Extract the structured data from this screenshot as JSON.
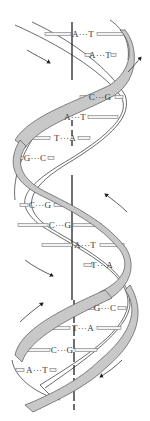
{
  "figure": {
    "colors": {
      "ribbon_fill": "#c8c8c8",
      "ribbon_stroke": "#555555",
      "strand": "#444444",
      "axis": "#222222",
      "bond_bar": "#f2f2f2",
      "bond_stroke": "#777777",
      "text": "#333333"
    },
    "base_pairs": [
      {
        "label": "A···T",
        "left": "A",
        "right": "T",
        "x": 83,
        "y": 34
      },
      {
        "label": "A···T",
        "left": "A",
        "right": "T",
        "x": 100,
        "y": 55
      },
      {
        "label": "C···G",
        "left": "C",
        "right": "G",
        "x": 100,
        "y": 97
      },
      {
        "label": "A···T",
        "left": "A",
        "right": "T",
        "x": 75,
        "y": 117
      },
      {
        "label": "T···A",
        "left": "T",
        "right": "A",
        "x": 65,
        "y": 138
      },
      {
        "label": "G···C",
        "left": "G",
        "right": "C",
        "x": 35,
        "y": 158
      },
      {
        "label": "C···G",
        "left": "C",
        "right": "G",
        "x": 40,
        "y": 205
      },
      {
        "label": "C···G",
        "left": "C",
        "right": "G",
        "x": 60,
        "y": 225
      },
      {
        "label": "A···T",
        "left": "A",
        "right": "T",
        "x": 85,
        "y": 245
      },
      {
        "label": "T···A",
        "left": "T",
        "right": "A",
        "x": 102,
        "y": 265
      },
      {
        "label": "G···C",
        "left": "G",
        "right": "C",
        "x": 105,
        "y": 308
      },
      {
        "label": "T···A",
        "left": "T",
        "right": "A",
        "x": 83,
        "y": 328
      },
      {
        "label": "C···G",
        "left": "C",
        "right": "G",
        "x": 62,
        "y": 350
      },
      {
        "label": "A···T",
        "left": "A",
        "right": "T",
        "x": 37,
        "y": 370
      }
    ],
    "arrows": [
      {
        "name": "strand-direction-arrow-top-left",
        "direction": "down-right"
      },
      {
        "name": "strand-direction-arrow-top-right",
        "direction": "up-right"
      },
      {
        "name": "strand-direction-arrow-mid-right",
        "direction": "up-left"
      },
      {
        "name": "strand-direction-arrow-mid-left",
        "direction": "down-right"
      },
      {
        "name": "strand-direction-arrow-bottom-left",
        "direction": "up-right"
      },
      {
        "name": "strand-direction-arrow-bottom-right",
        "direction": "down-left"
      }
    ]
  }
}
